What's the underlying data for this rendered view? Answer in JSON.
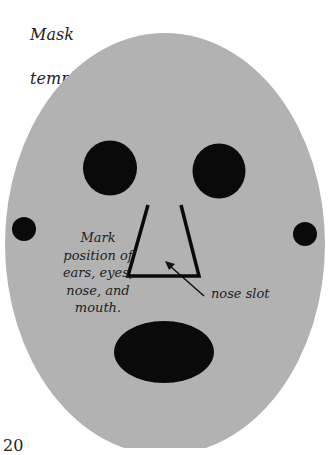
{
  "figure": {
    "title_lines": [
      "Mask",
      "template"
    ],
    "face_color": "#b2b2b2",
    "feature_color": "#0a0a0a"
  },
  "annotations": {
    "marking_note_lines": [
      "Mark",
      "position of",
      "ears, eyes,",
      "nose, and",
      "mouth."
    ],
    "nose_label": "nose slot"
  },
  "page": {
    "number": "20"
  }
}
